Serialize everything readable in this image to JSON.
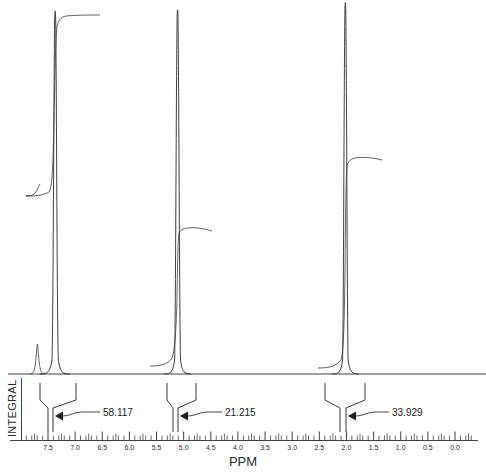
{
  "axis": {
    "title": "PPM",
    "integral_label": "INTEGRAL",
    "tick_labels": [
      "7.5",
      "7.0",
      "6.5",
      "6.0",
      "5.5",
      "5.0",
      "4.5",
      "4.0",
      "3.5",
      "3.0",
      "2.5",
      "2.0",
      "1.5",
      "1.0",
      "0.5",
      "0.0"
    ],
    "direction": "right-to-left",
    "min_ppm": 0.0,
    "max_ppm": 7.5,
    "minor_ticks_per_major": 5
  },
  "chart_data": {
    "type": "line",
    "title": "",
    "subtitle": "",
    "xlabel": "PPM",
    "ylabel": "",
    "xlim": [
      7.9,
      -0.3
    ],
    "ylim": [
      0,
      1
    ],
    "grid": false,
    "legend": "none",
    "annotations": [
      "58.117",
      "21.215",
      "33.929"
    ],
    "series": [
      {
        "name": "spectrum",
        "peaks": [
          {
            "ppm": 7.3,
            "rel_height": 1.0,
            "label": ""
          },
          {
            "ppm": 7.64,
            "rel_height": 0.06,
            "label": ""
          },
          {
            "ppm": 5.08,
            "rel_height": 0.98,
            "label": ""
          },
          {
            "ppm": 1.99,
            "rel_height": 1.02,
            "label": ""
          }
        ]
      },
      {
        "name": "integral",
        "steps": [
          {
            "ppm": 7.3,
            "value": 58.117,
            "plateau": 0.955
          },
          {
            "ppm": 5.08,
            "value": 21.215,
            "plateau": 0.415
          },
          {
            "ppm": 1.99,
            "value": 33.929,
            "plateau": 0.61
          }
        ]
      }
    ]
  },
  "integrals": [
    {
      "value": "58.117",
      "ppm": 7.3
    },
    {
      "value": "21.215",
      "ppm": 5.08
    },
    {
      "value": "33.929",
      "ppm": 1.99
    }
  ],
  "colors": {
    "trace": "#2a2a2a",
    "axis": "#2b2b2b",
    "background": "#ffffff",
    "text": "#1a1a1a"
  }
}
